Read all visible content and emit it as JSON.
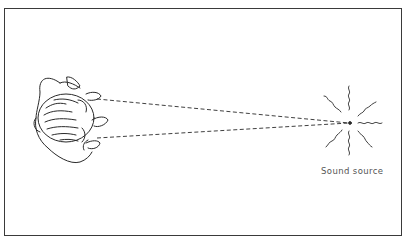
{
  "diagram": {
    "elements": {
      "listener": "person seen from above",
      "sound_source": {
        "label": "Sound source",
        "icon": "radiating-wavy-lines"
      },
      "sight_lines": [
        "left-ear-to-source",
        "right-ear-to-source"
      ]
    },
    "colors": {
      "line": "#2a2a2a",
      "border": "#3a3a3a",
      "label": "#555555",
      "background": "#ffffff"
    }
  }
}
